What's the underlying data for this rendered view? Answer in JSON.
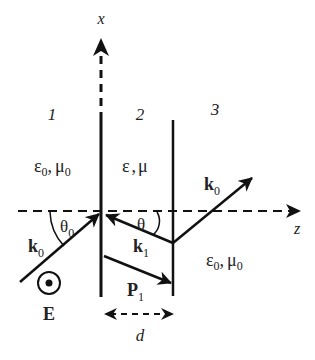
{
  "diagram": {
    "axes": {
      "x_label": "x",
      "z_label": "z"
    },
    "regions": [
      {
        "id": "1",
        "label": "1",
        "medium": {
          "eps": "ε",
          "eps_sub": "0",
          "mu": "μ",
          "mu_sub": "0"
        }
      },
      {
        "id": "2",
        "label": "2",
        "medium": {
          "eps": "ε",
          "mu": "μ"
        }
      },
      {
        "id": "3",
        "label": "3",
        "medium": {
          "eps": "ε",
          "eps_sub": "0",
          "mu": "μ",
          "mu_sub": "0"
        }
      }
    ],
    "vectors": {
      "incident": {
        "base": "k",
        "sub": "0"
      },
      "reflected_inside": {
        "base": "k",
        "sub": "1"
      },
      "poynting": {
        "base": "P",
        "sub": "1"
      },
      "transmitted": {
        "base": "k",
        "sub": "0"
      }
    },
    "angles": {
      "theta0": {
        "base": "θ",
        "sub": "0"
      },
      "theta": {
        "base": "θ"
      }
    },
    "field": {
      "label": "E"
    },
    "thickness": {
      "label": "d"
    },
    "separator": ","
  }
}
